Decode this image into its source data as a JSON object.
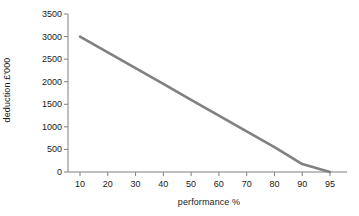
{
  "chart_data": {
    "type": "line",
    "title": "",
    "xlabel": "performance %",
    "ylabel": "deduction £'000",
    "x": [
      10,
      20,
      30,
      40,
      50,
      60,
      70,
      80,
      90,
      95
    ],
    "xtick_labels": [
      "10",
      "20",
      "30",
      "40",
      "50",
      "60",
      "70",
      "80",
      "90",
      "95"
    ],
    "ytick_labels": [
      "0",
      "500",
      "1000",
      "1500",
      "2000",
      "2500",
      "3000",
      "3500"
    ],
    "yticks": [
      0,
      500,
      1000,
      1500,
      2000,
      2500,
      3000,
      3500
    ],
    "ylim": [
      0,
      3500
    ],
    "grid": false,
    "legend": false,
    "series": [
      {
        "name": "deduction",
        "color": "#808080",
        "values": [
          3000,
          2650,
          2300,
          1950,
          1600,
          1250,
          900,
          550,
          175,
          0
        ]
      }
    ],
    "axis_color": "#808080",
    "text_color": "#1a1a1a",
    "background": "#ffffff"
  }
}
